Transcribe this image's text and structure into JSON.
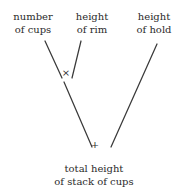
{
  "diagram": {
    "background_color": "#ffffff",
    "stroke_color": "#3a3a3a",
    "text_color": "#2b2b2b",
    "inputs": [
      {
        "id": "cups",
        "line1": "number",
        "line2": "of cups"
      },
      {
        "id": "rim",
        "line1": "height",
        "line2": "of rim"
      },
      {
        "id": "hold",
        "line1": "height",
        "line2": "of hold"
      }
    ],
    "operators": [
      {
        "id": "times",
        "symbol": "×",
        "name": "multiply"
      },
      {
        "id": "plus",
        "symbol": "+",
        "name": "add"
      }
    ],
    "result": {
      "id": "total",
      "line1": "total height",
      "line2": "of stack of cups"
    },
    "edges": [
      {
        "from": "cups",
        "to": "times",
        "x1": 45,
        "y1": 41,
        "x2": 62,
        "y2": 78
      },
      {
        "from": "rim",
        "to": "times",
        "x1": 81,
        "y1": 41,
        "x2": 72,
        "y2": 78
      },
      {
        "from": "times",
        "to": "plus",
        "x1": 64,
        "y1": 82,
        "x2": 92,
        "y2": 147
      },
      {
        "from": "hold",
        "to": "plus",
        "x1": 157,
        "y1": 44,
        "x2": 111,
        "y2": 147
      }
    ]
  }
}
